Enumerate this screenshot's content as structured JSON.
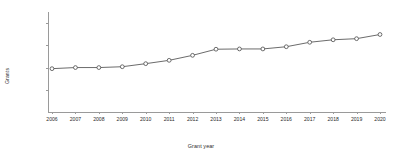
{
  "chart_data": {
    "type": "line",
    "title": "",
    "xlabel": "Grant year",
    "ylabel": "Grants",
    "categories": [
      "2006",
      "2007",
      "2008",
      "2009",
      "2010",
      "2011",
      "2012",
      "2013",
      "2014",
      "2015",
      "2016",
      "2017",
      "2018",
      "2019",
      "2020"
    ],
    "x": [
      2006,
      2007,
      2008,
      2009,
      2010,
      2011,
      2012,
      2013,
      2014,
      2015,
      2016,
      2017,
      2018,
      2019,
      2020
    ],
    "values": [
      780000,
      800000,
      800000,
      815000,
      870000,
      930000,
      1020000,
      1130000,
      1135000,
      1135000,
      1175000,
      1255000,
      1300000,
      1320000,
      1395000
    ],
    "series": [
      {
        "name": "Grants",
        "values": [
          780000,
          800000,
          800000,
          815000,
          870000,
          930000,
          1020000,
          1130000,
          1135000,
          1135000,
          1175000,
          1255000,
          1300000,
          1320000,
          1395000
        ]
      }
    ],
    "ylim": [
      0,
      1800000
    ],
    "xlim": [
      2006,
      2020
    ],
    "yticks": [
      400000,
      800000,
      1200000,
      1600000
    ],
    "ytick_labels": [
      "400,000",
      "800,000",
      "1,200,000",
      "1,600,000"
    ],
    "grid": false,
    "legend": "none",
    "marker": "open-circle",
    "line_color": "#5a5a5a",
    "marker_color": "#ffffff",
    "marker_edge_color": "#4a4a4a",
    "axis_color": "#9a9a9a",
    "text_color": "#2b2b2b"
  }
}
